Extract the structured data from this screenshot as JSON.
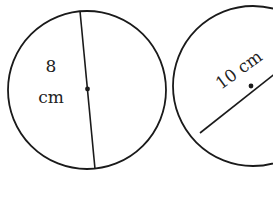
{
  "diagram": {
    "stroke_color": "#1a1a1a",
    "background": "#ffffff",
    "circles": [
      {
        "id": "left",
        "center": [
          87,
          90
        ],
        "radius": 79,
        "measurement": "diameter",
        "label_value": "8",
        "label_unit": "cm",
        "line": {
          "from": [
            80,
            10
          ],
          "to": [
            95,
            171
          ]
        }
      },
      {
        "id": "right",
        "center": [
          251,
          86
        ],
        "radius": 80,
        "measurement": "diameter",
        "label": "10 cm",
        "line": {
          "from": [
            200,
            132
          ],
          "to": [
            302,
            40
          ]
        }
      }
    ]
  }
}
